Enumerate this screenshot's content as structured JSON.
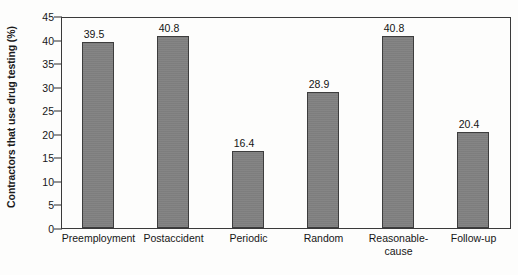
{
  "chart_data": {
    "type": "bar",
    "title": "",
    "subtitle": "",
    "xlabel": "",
    "ylabel": "Contractors that use drug testing (%)",
    "categories": [
      "Preemployment",
      "Postaccident",
      "Periodic",
      "Random",
      "Reasonable-cause",
      "Follow-up"
    ],
    "category_lines": [
      [
        "Preemployment"
      ],
      [
        "Postaccident"
      ],
      [
        "Periodic"
      ],
      [
        "Random"
      ],
      [
        "Reasonable-",
        "cause"
      ],
      [
        "Follow-up"
      ]
    ],
    "values": [
      39.5,
      40.8,
      16.4,
      28.9,
      40.8,
      20.4
    ],
    "value_labels": [
      "39.5",
      "40.8",
      "16.4",
      "28.9",
      "40.8",
      "20.4"
    ],
    "ylim": [
      0,
      45
    ],
    "ytick_values": [
      0,
      5,
      10,
      15,
      20,
      25,
      30,
      35,
      40,
      45
    ],
    "ytick_labels": [
      "0",
      "5",
      "10",
      "15",
      "20",
      "25",
      "30",
      "35",
      "40",
      "45"
    ],
    "grid": false,
    "legend": null,
    "legend_position": "none",
    "annotations": [],
    "colors": {
      "bar_fill": "#808080",
      "bar_edge": "#3d3d3d",
      "axis": "#3a3a3a",
      "text": "#161616",
      "background": "#fdfdfc"
    }
  }
}
